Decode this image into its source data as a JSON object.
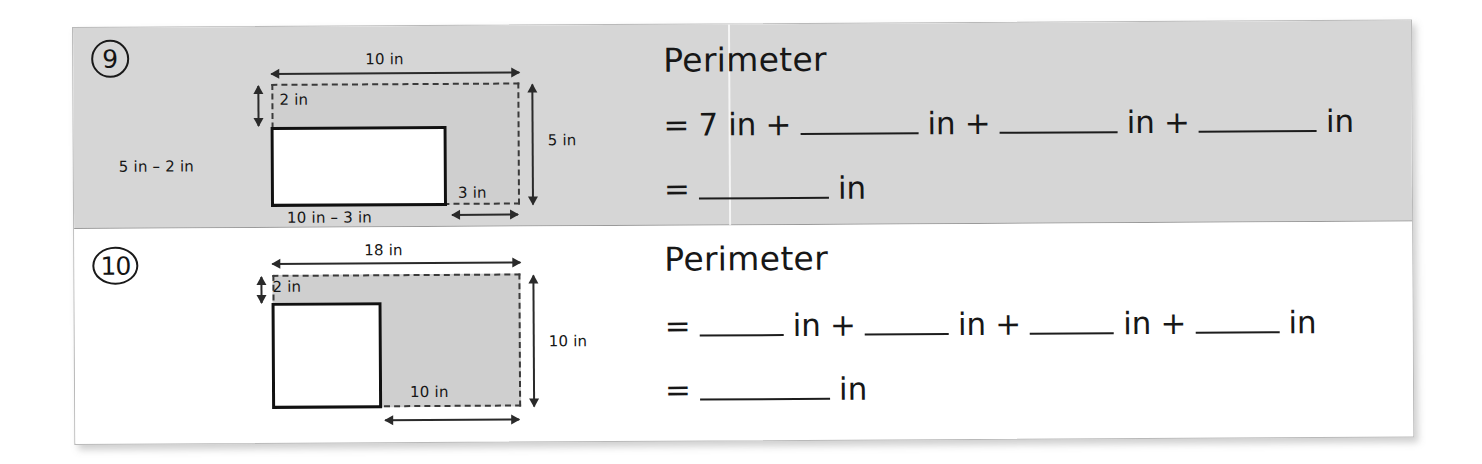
{
  "page": {
    "background": "#ffffff",
    "card_background": "#ffffff",
    "row9_background": "#d6d6d6",
    "row10_background": "#ffffff",
    "ink_color": "#171717",
    "shape_fill_color": "#cfcfcf"
  },
  "problems": [
    {
      "number": "9",
      "figure": {
        "type": "L-shape-from-rectangle",
        "outer_top_label": "10 in",
        "outer_right_label": "5 in",
        "notch_height_label": "2 in",
        "notch_width_label": "3 in",
        "left_side_label": "5 in – 2 in",
        "bottom_label": "10 in – 3 in",
        "outer_width_in": 10,
        "outer_height_in": 5,
        "cut_width_in": 3,
        "cut_height_in": 2,
        "solid_width_in": 7,
        "solid_height_in": 3
      },
      "work": {
        "title": "Perimeter",
        "line1": {
          "equals": "=",
          "first_value": "7 in",
          "plus": "+",
          "unit": "in",
          "blanks": 3
        },
        "line2": {
          "equals": "=",
          "unit": "in",
          "blanks": 1
        }
      }
    },
    {
      "number": "10",
      "figure": {
        "type": "L-shape-from-rectangle",
        "outer_top_label": "18 in",
        "outer_right_label": "10 in",
        "notch_height_label": "2 in",
        "bottom_label": "10 in",
        "outer_width_in": 18,
        "outer_height_in": 10,
        "cut_width_in": 10,
        "cut_height_in": 2,
        "solid_width_in": 8,
        "solid_height_in": 8
      },
      "work": {
        "title": "Perimeter",
        "line1": {
          "equals": "=",
          "plus": "+",
          "unit": "in",
          "blanks": 4
        },
        "line2": {
          "equals": "=",
          "unit": "in",
          "blanks": 1
        }
      }
    }
  ]
}
